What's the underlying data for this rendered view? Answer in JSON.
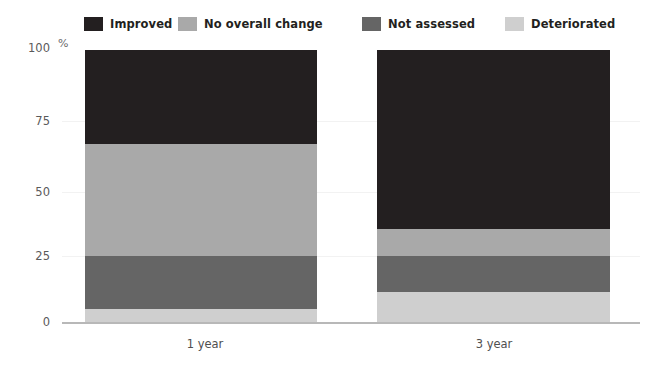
{
  "chart_data": {
    "type": "bar",
    "subtype": "stacked-bar-100-percent",
    "title": "",
    "xlabel": "",
    "ylabel": "%",
    "ylim": [
      0,
      100
    ],
    "yticks": [
      0,
      25,
      50,
      75,
      100
    ],
    "ytick_labels": [
      "0",
      "25",
      "50",
      "75",
      "100"
    ],
    "grid": true,
    "legend_position": "top",
    "categories": [
      "1 year",
      "3 year"
    ],
    "series": [
      {
        "name": "Improved",
        "color": "#231f20",
        "values": [
          35,
          66
        ]
      },
      {
        "name": "No overall change",
        "color": "#a9a9a9",
        "values": [
          42,
          10
        ]
      },
      {
        "name": "Not assessed",
        "color": "#656565",
        "values": [
          19,
          13
        ]
      },
      {
        "name": "Deteriorated",
        "color": "#cfcfcf",
        "values": [
          4,
          11
        ]
      }
    ],
    "stack_order_top_to_bottom": [
      "Improved",
      "No overall change",
      "Not assessed",
      "Deteriorated"
    ]
  },
  "legend": {
    "items": [
      {
        "label": "Improved",
        "color": "#231f20",
        "left": 84
      },
      {
        "label": "No overall change",
        "color": "#a9a9a9",
        "left": 178
      },
      {
        "label": "Not assessed",
        "color": "#656565",
        "left": 362
      },
      {
        "label": "Deteriorated",
        "color": "#cfcfcf",
        "left": 505
      }
    ]
  },
  "axes": {
    "y_unit_symbol": "%",
    "y_ticks": [
      {
        "label": "100",
        "top": 42
      },
      {
        "label": "75",
        "top": 115
      },
      {
        "label": "50",
        "top": 186
      },
      {
        "label": "25",
        "top": 250
      },
      {
        "label": "0",
        "top": 316
      }
    ],
    "x_ticks": [
      {
        "label": "1 year",
        "left": 145
      },
      {
        "label": "3 year",
        "left": 434
      }
    ]
  },
  "bars": [
    {
      "name": "1 year",
      "left": 85,
      "width": 232,
      "top": 50,
      "height": 272,
      "segments": [
        {
          "name": "Improved",
          "color": "#231f20",
          "height": 94
        },
        {
          "name": "No overall change",
          "color": "#a9a9a9",
          "height": 112
        },
        {
          "name": "Not assessed",
          "color": "#656565",
          "height": 53
        },
        {
          "name": "Deteriorated",
          "color": "#cfcfcf",
          "height": 13
        }
      ]
    },
    {
      "name": "3 year",
      "left": 377,
      "width": 233,
      "top": 50,
      "height": 272,
      "segments": [
        {
          "name": "Improved",
          "color": "#231f20",
          "height": 179
        },
        {
          "name": "No overall change",
          "color": "#a9a9a9",
          "height": 27
        },
        {
          "name": "Not assessed",
          "color": "#656565",
          "height": 36
        },
        {
          "name": "Deteriorated",
          "color": "#cfcfcf",
          "height": 30
        }
      ]
    }
  ],
  "gridlines": [
    {
      "top": 121
    },
    {
      "top": 192
    },
    {
      "top": 256
    }
  ],
  "axis_baseline": {
    "top": 322
  }
}
